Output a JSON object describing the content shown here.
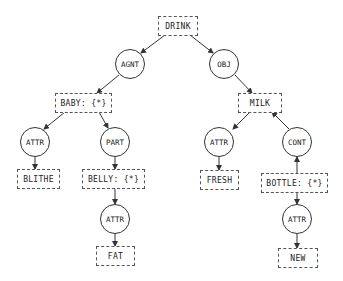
{
  "concepts": {
    "drink": "DRINK",
    "baby": "BABY: {*}",
    "milk": "MILK",
    "blithe": "BLITHE",
    "belly": "BELLY: {*}",
    "fresh": "FRESH",
    "bottle": "BOTTLE: {*}",
    "fat": "FAT",
    "new": "NEW"
  },
  "relations": {
    "agnt": "AGNT",
    "obj": "OBJ",
    "attr_baby": "ATTR",
    "part": "PART",
    "attr_milk": "ATTR",
    "cont": "CONT",
    "attr_belly": "ATTR",
    "attr_bottle": "ATTR"
  },
  "edges": [
    {
      "from": "DRINK",
      "to": "AGNT"
    },
    {
      "from": "AGNT",
      "to": "BABY"
    },
    {
      "from": "DRINK",
      "to": "OBJ"
    },
    {
      "from": "OBJ",
      "to": "MILK"
    },
    {
      "from": "BABY",
      "to": "ATTR"
    },
    {
      "from": "ATTR",
      "to": "BLITHE"
    },
    {
      "from": "BABY",
      "to": "PART"
    },
    {
      "from": "PART",
      "to": "BELLY"
    },
    {
      "from": "BELLY",
      "to": "ATTR"
    },
    {
      "from": "ATTR",
      "to": "FAT"
    },
    {
      "from": "MILK",
      "to": "ATTR"
    },
    {
      "from": "ATTR",
      "to": "FRESH"
    },
    {
      "from": "BOTTLE",
      "to": "CONT"
    },
    {
      "from": "CONT",
      "to": "MILK"
    },
    {
      "from": "BOTTLE",
      "to": "ATTR"
    },
    {
      "from": "ATTR",
      "to": "NEW"
    }
  ]
}
